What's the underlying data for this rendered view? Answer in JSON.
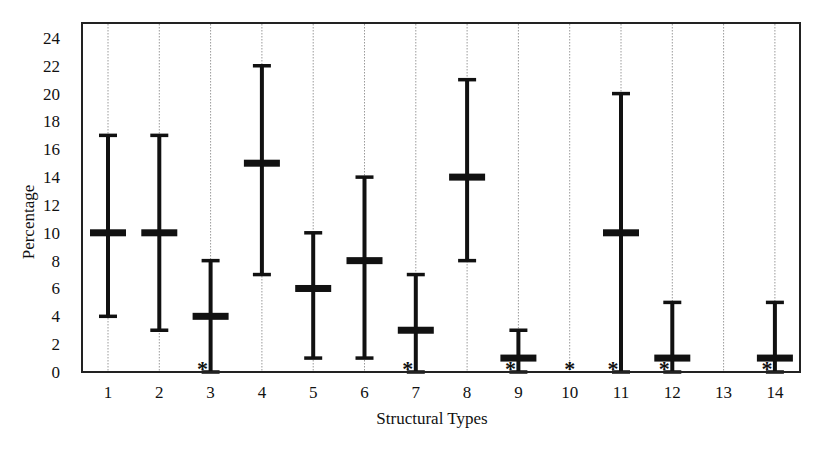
{
  "chart_data": {
    "type": "errorbar",
    "title": "",
    "xlabel": "Structural Types",
    "ylabel": "Percentage",
    "ylim": [
      0,
      25
    ],
    "yticks": [
      0,
      2,
      4,
      6,
      8,
      10,
      12,
      14,
      16,
      18,
      20,
      22,
      24
    ],
    "categories": [
      "1",
      "2",
      "3",
      "4",
      "5",
      "6",
      "7",
      "8",
      "9",
      "10",
      "11",
      "12",
      "13",
      "14"
    ],
    "series": [
      {
        "name": "mean",
        "values": [
          10,
          10,
          4,
          15,
          6,
          8,
          3,
          14,
          1,
          null,
          10,
          1,
          null,
          1
        ]
      },
      {
        "name": "low",
        "values": [
          4,
          3,
          0,
          7,
          1,
          1,
          0,
          8,
          0,
          null,
          0,
          0,
          null,
          0
        ]
      },
      {
        "name": "high",
        "values": [
          17,
          17,
          8,
          22,
          10,
          14,
          7,
          21,
          3,
          null,
          20,
          5,
          null,
          5
        ]
      }
    ],
    "asterisk_at_zero": [
      false,
      false,
      true,
      false,
      false,
      false,
      true,
      false,
      true,
      true,
      true,
      true,
      false,
      true
    ],
    "grid": {
      "vertical_dotted": true,
      "horizontal": false
    },
    "legend": null
  },
  "labels": {
    "xlabel": "Structural Types",
    "ylabel": "Percentage",
    "asterisk": "*"
  },
  "colors": {
    "bars": "#111111",
    "frame": "#222222",
    "grid": "#9a9a9a"
  }
}
